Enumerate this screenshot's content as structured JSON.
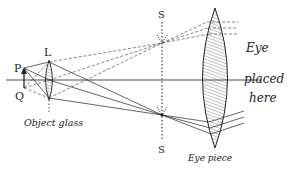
{
  "figure": {
    "type": "optical-diagram",
    "labels": {
      "object_top": "P",
      "object_bottom": "Q",
      "objective_lens_letter": "L",
      "objective_caption": "Object glass",
      "image_plane_top": "S",
      "image_plane_bottom": "S",
      "eyepiece_caption": "Eye piece",
      "eye_line1": "Eye",
      "eye_line2": "placed",
      "eye_line3": "here"
    },
    "colors": {
      "ink": "#222222",
      "background": "#ffffff"
    }
  }
}
